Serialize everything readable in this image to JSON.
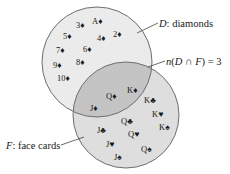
{
  "diagram": {
    "type": "venn",
    "colors": {
      "background": "#ffffff",
      "set_d_fill": "#ebebeb",
      "set_f_fill": "#dedede",
      "intersection_fill": "#c4c4c4",
      "outline": "#6e6e6e",
      "leader": "#444444",
      "text": "#1a1a1a"
    },
    "sets": {
      "D": {
        "letter": "D",
        "name": "diamonds",
        "label_rest": ": diamonds",
        "only_items": [
          {
            "text": "3♦",
            "x": 76,
            "y": 28
          },
          {
            "text": "A♦",
            "x": 92,
            "y": 24
          },
          {
            "text": "5♦",
            "x": 63,
            "y": 39
          },
          {
            "text": "4♦",
            "x": 97,
            "y": 41
          },
          {
            "text": "2♦",
            "x": 113,
            "y": 37
          },
          {
            "text": "7♦",
            "x": 56,
            "y": 53
          },
          {
            "text": "6♦",
            "x": 83,
            "y": 52
          },
          {
            "text": "9♦",
            "x": 53,
            "y": 68
          },
          {
            "text": "8♦",
            "x": 76,
            "y": 65
          },
          {
            "text": "10♦",
            "x": 57,
            "y": 81
          }
        ]
      },
      "F": {
        "letter": "F",
        "name": "face cards",
        "label_rest": ": face cards",
        "only_items": [
          {
            "text": "K♣",
            "x": 144,
            "y": 103
          },
          {
            "text": "K♥",
            "x": 152,
            "y": 117
          },
          {
            "text": "K♠",
            "x": 159,
            "y": 130
          },
          {
            "text": "J♣",
            "x": 97,
            "y": 133
          },
          {
            "text": "Q♣",
            "x": 121,
            "y": 124
          },
          {
            "text": "J♥",
            "x": 106,
            "y": 147
          },
          {
            "text": "Q♥",
            "x": 128,
            "y": 137
          },
          {
            "text": "J♠",
            "x": 114,
            "y": 160
          },
          {
            "text": "Q♠",
            "x": 141,
            "y": 152
          }
        ]
      }
    },
    "intersection": {
      "items": [
        {
          "text": "K♦",
          "x": 127,
          "y": 93
        },
        {
          "text": "Q♦",
          "x": 106,
          "y": 99
        },
        {
          "text": "J♦",
          "x": 90,
          "y": 111
        }
      ],
      "annotation": "n(D ∩ F) = 3",
      "count": 3
    },
    "geometry": {
      "circle_d": {
        "cx": 97,
        "cy": 62,
        "r": 55
      },
      "circle_f": {
        "cx": 126,
        "cy": 115,
        "r": 53
      }
    }
  },
  "labels": {
    "d_label": {
      "letter": "D",
      "rest": ": diamonds"
    },
    "f_label": {
      "letter": "F",
      "rest": ": face cards"
    },
    "intersection_label": {
      "n": "n",
      "open": "(",
      "d": "D",
      "cap": " ∩ ",
      "f": "F",
      "close": ")",
      "eq": " = 3"
    }
  }
}
